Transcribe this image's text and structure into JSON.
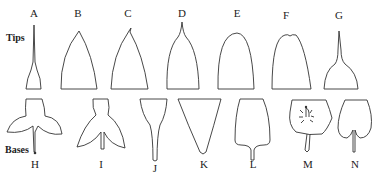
{
  "diagram": {
    "row_labels": {
      "tips": "Tips",
      "bases": "Bases"
    },
    "tips": [
      {
        "letter": "A",
        "shape": "acuminate-long"
      },
      {
        "letter": "B",
        "shape": "acute"
      },
      {
        "letter": "C",
        "shape": "mucronate"
      },
      {
        "letter": "D",
        "shape": "cuspidate"
      },
      {
        "letter": "E",
        "shape": "obtuse"
      },
      {
        "letter": "F",
        "shape": "retuse"
      },
      {
        "letter": "G",
        "shape": "acuminate"
      }
    ],
    "bases": [
      {
        "letter": "H",
        "shape": "sagittate-lobed"
      },
      {
        "letter": "I",
        "shape": "hastate-lobed"
      },
      {
        "letter": "J",
        "shape": "attenuate"
      },
      {
        "letter": "K",
        "shape": "cuneate"
      },
      {
        "letter": "L",
        "shape": "truncate-rounded"
      },
      {
        "letter": "M",
        "shape": "peltate"
      },
      {
        "letter": "N",
        "shape": "cordate"
      }
    ]
  }
}
